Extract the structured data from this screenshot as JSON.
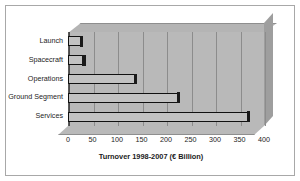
{
  "chart_data": {
    "type": "bar",
    "orientation": "horizontal",
    "title": "",
    "xlabel": "Turnover 1998-2007 (€ Billion)",
    "ylabel": "",
    "categories": [
      "Launch",
      "Spacecraft",
      "Operations",
      "Ground Segment",
      "Services"
    ],
    "values": [
      30,
      35,
      140,
      228,
      370
    ],
    "xlim": [
      0,
      400
    ],
    "xticks": [
      0,
      50,
      100,
      150,
      200,
      250,
      300,
      350,
      400
    ],
    "xtick_labels": [
      "0",
      "50",
      "100",
      "150",
      "200",
      "250",
      "300",
      "350",
      "400"
    ],
    "grid": true,
    "legend": false,
    "style": "3d",
    "colors": {
      "plot_background": "#b9b9b9",
      "plot_top_face": "#b4b4b4",
      "plot_right_face": "#9e9e9e",
      "bar_fill": "#c2c2c2",
      "bar_outline": "#111111",
      "gridline": "#8c8c8c",
      "frame_border": "#a8a8a8",
      "page_background": "#ffffff",
      "text": "#1c1c1c"
    }
  }
}
